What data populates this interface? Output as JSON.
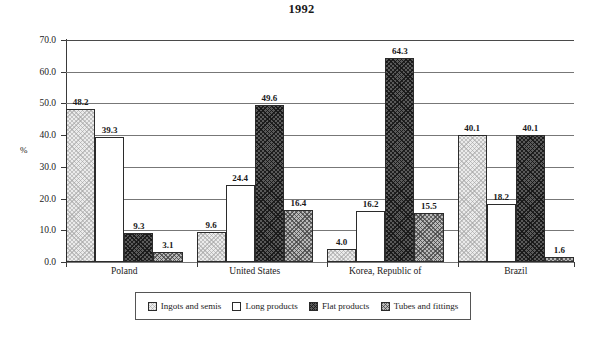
{
  "chart_data": {
    "type": "bar",
    "title": "1992",
    "xlabel": "",
    "ylabel": "%",
    "ylim": [
      0.0,
      70.0
    ],
    "ytick_labels": [
      "0.0",
      "10.0",
      "20.0",
      "30.0",
      "40.0",
      "50.0",
      "60.0",
      "70.0"
    ],
    "ytick_values": [
      0.0,
      10.0,
      20.0,
      30.0,
      40.0,
      50.0,
      60.0,
      70.0
    ],
    "grid": true,
    "legend_position": "bottom",
    "categories": [
      "Poland",
      "United States",
      "Korea, Republic of",
      "Brazil"
    ],
    "series": [
      {
        "name": "Ingots and semis",
        "pattern": "light-checker",
        "values": [
          48.2,
          9.6,
          4.0,
          40.1
        ]
      },
      {
        "name": "Long products",
        "pattern": "white",
        "values": [
          39.3,
          24.4,
          16.2,
          18.2
        ]
      },
      {
        "name": "Flat products",
        "pattern": "dark-checker",
        "values": [
          9.3,
          49.6,
          64.3,
          40.1
        ]
      },
      {
        "name": "Tubes and fittings",
        "pattern": "gray-checker",
        "values": [
          3.1,
          16.4,
          15.5,
          1.6
        ]
      }
    ],
    "value_labels": [
      [
        "48.2",
        "39.3",
        "9.3",
        "3.1"
      ],
      [
        "9.6",
        "24.4",
        "49.6",
        "16.4"
      ],
      [
        "4.0",
        "16.2",
        "64.3",
        "15.5"
      ],
      [
        "40.1",
        "18.2",
        "40.1",
        "1.6"
      ]
    ],
    "colors": {
      "ingots_and_semis": "#ebebeb",
      "long_products": "#ffffff",
      "flat_products": "#5a5a5a",
      "tubes_and_fittings": "#b9b9b9",
      "axis": "#3a3a3a",
      "gridline": "#777777",
      "text": "#1a1a1a",
      "background": "#ffffff"
    }
  },
  "legend": {
    "items": [
      {
        "label": "Ingots and semis"
      },
      {
        "label": "Long products"
      },
      {
        "label": "Flat products"
      },
      {
        "label": "Tubes and fittings"
      }
    ]
  }
}
